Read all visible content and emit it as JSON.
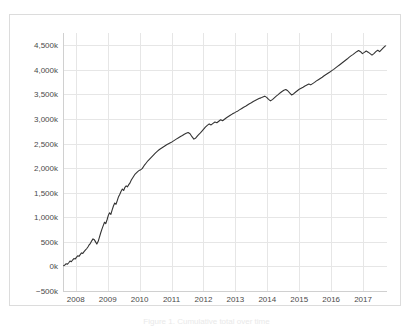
{
  "figure": {
    "caption": "Figure 1. Cumulative total over time",
    "background_color": "#ffffff",
    "border_color": "#dcdcdc"
  },
  "chart_data": {
    "type": "line",
    "title": "",
    "subtitle": "",
    "xlabel": "",
    "ylabel": "",
    "grid": true,
    "legend": false,
    "legend_position": "none",
    "line_color": "#333333",
    "gridline_color": "#e6e6e6",
    "axis_color": "#d0d0d0",
    "xlim": [
      2007.6,
      2017.75
    ],
    "ylim": [
      -500000,
      4750000
    ],
    "ytick_values": [
      -500000,
      0,
      500000,
      1000000,
      1500000,
      2000000,
      2500000,
      3000000,
      3500000,
      4000000,
      4500000
    ],
    "ytick_labels": [
      "−500k",
      "0k",
      "500k",
      "1,000k",
      "1,500k",
      "2,000k",
      "2,500k",
      "3,000k",
      "3,500k",
      "4,000k",
      "4,500k"
    ],
    "xtick_values": [
      2008,
      2009,
      2010,
      2011,
      2012,
      2013,
      2014,
      2015,
      2016,
      2017
    ],
    "xtick_labels": [
      "2008",
      "2009",
      "2010",
      "2011",
      "2012",
      "2013",
      "2014",
      "2015",
      "2016",
      "2017"
    ],
    "series": [
      {
        "name": "cumulative total",
        "x": [
          2007.62,
          2007.66,
          2007.7,
          2007.74,
          2007.78,
          2007.82,
          2007.86,
          2007.9,
          2007.94,
          2007.98,
          2008.02,
          2008.06,
          2008.1,
          2008.14,
          2008.18,
          2008.22,
          2008.26,
          2008.3,
          2008.34,
          2008.38,
          2008.42,
          2008.46,
          2008.5,
          2008.54,
          2008.58,
          2008.62,
          2008.66,
          2008.7,
          2008.74,
          2008.78,
          2008.82,
          2008.86,
          2008.9,
          2008.94,
          2008.98,
          2009.02,
          2009.06,
          2009.1,
          2009.14,
          2009.18,
          2009.22,
          2009.26,
          2009.3,
          2009.34,
          2009.38,
          2009.42,
          2009.46,
          2009.5,
          2009.54,
          2009.58,
          2009.62,
          2009.66,
          2009.7,
          2009.74,
          2009.78,
          2009.82,
          2009.86,
          2009.9,
          2009.94,
          2009.98,
          2010.02,
          2010.08,
          2010.14,
          2010.2,
          2010.26,
          2010.32,
          2010.38,
          2010.44,
          2010.5,
          2010.56,
          2010.62,
          2010.68,
          2010.74,
          2010.8,
          2010.86,
          2010.92,
          2010.98,
          2011.04,
          2011.1,
          2011.16,
          2011.22,
          2011.28,
          2011.34,
          2011.4,
          2011.46,
          2011.52,
          2011.58,
          2011.64,
          2011.7,
          2011.76,
          2011.82,
          2011.88,
          2011.94,
          2012.0,
          2012.06,
          2012.12,
          2012.18,
          2012.24,
          2012.3,
          2012.36,
          2012.42,
          2012.48,
          2012.54,
          2012.6,
          2012.66,
          2012.72,
          2012.78,
          2012.84,
          2012.9,
          2012.96,
          2013.02,
          2013.08,
          2013.14,
          2013.2,
          2013.26,
          2013.32,
          2013.38,
          2013.44,
          2013.5,
          2013.56,
          2013.62,
          2013.68,
          2013.74,
          2013.8,
          2013.86,
          2013.92,
          2013.98,
          2014.04,
          2014.1,
          2014.16,
          2014.22,
          2014.28,
          2014.34,
          2014.4,
          2014.46,
          2014.52,
          2014.58,
          2014.64,
          2014.7,
          2014.76,
          2014.82,
          2014.88,
          2014.94,
          2015.0,
          2015.06,
          2015.12,
          2015.18,
          2015.24,
          2015.3,
          2015.36,
          2015.42,
          2015.48,
          2015.54,
          2015.6,
          2015.66,
          2015.72,
          2015.78,
          2015.84,
          2015.9,
          2015.96,
          2016.02,
          2016.08,
          2016.14,
          2016.2,
          2016.26,
          2016.32,
          2016.38,
          2016.44,
          2016.5,
          2016.56,
          2016.62,
          2016.68,
          2016.74,
          2016.8,
          2016.86,
          2016.92,
          2016.98,
          2017.04,
          2017.1,
          2017.16,
          2017.22,
          2017.28,
          2017.34,
          2017.4,
          2017.46,
          2017.52,
          2017.58,
          2017.64,
          2017.7
        ],
        "y": [
          15000,
          30000,
          55000,
          45000,
          75000,
          110000,
          95000,
          130000,
          160000,
          150000,
          185000,
          215000,
          205000,
          240000,
          275000,
          265000,
          300000,
          330000,
          360000,
          395000,
          440000,
          470000,
          520000,
          560000,
          545000,
          500000,
          455000,
          505000,
          590000,
          680000,
          760000,
          830000,
          900000,
          870000,
          950000,
          1040000,
          1090000,
          1060000,
          1150000,
          1230000,
          1290000,
          1265000,
          1340000,
          1420000,
          1470000,
          1530000,
          1575000,
          1545000,
          1610000,
          1640000,
          1620000,
          1665000,
          1700000,
          1760000,
          1800000,
          1840000,
          1880000,
          1905000,
          1930000,
          1950000,
          1960000,
          1990000,
          2050000,
          2100000,
          2150000,
          2190000,
          2230000,
          2270000,
          2310000,
          2345000,
          2380000,
          2405000,
          2430000,
          2455000,
          2480000,
          2500000,
          2520000,
          2545000,
          2570000,
          2595000,
          2620000,
          2645000,
          2665000,
          2690000,
          2710000,
          2725000,
          2700000,
          2640000,
          2590000,
          2615000,
          2660000,
          2700000,
          2745000,
          2790000,
          2835000,
          2870000,
          2900000,
          2880000,
          2910000,
          2940000,
          2925000,
          2955000,
          2985000,
          2965000,
          2995000,
          3025000,
          3050000,
          3075000,
          3100000,
          3120000,
          3145000,
          3165000,
          3190000,
          3215000,
          3240000,
          3260000,
          3285000,
          3310000,
          3330000,
          3355000,
          3375000,
          3395000,
          3415000,
          3430000,
          3450000,
          3465000,
          3440000,
          3400000,
          3370000,
          3395000,
          3430000,
          3465000,
          3495000,
          3530000,
          3560000,
          3585000,
          3600000,
          3575000,
          3530000,
          3490000,
          3510000,
          3545000,
          3575000,
          3605000,
          3625000,
          3645000,
          3670000,
          3690000,
          3710000,
          3695000,
          3720000,
          3745000,
          3775000,
          3800000,
          3825000,
          3850000,
          3880000,
          3905000,
          3930000,
          3955000,
          3985000,
          4010000,
          4040000,
          4070000,
          4100000,
          4130000,
          4160000,
          4190000,
          4220000,
          4255000,
          4285000,
          4310000,
          4340000,
          4370000,
          4395000,
          4370000,
          4330000,
          4355000,
          4385000,
          4360000,
          4330000,
          4300000,
          4330000,
          4370000,
          4400000,
          4370000,
          4410000,
          4450000,
          4490000
        ]
      }
    ]
  }
}
